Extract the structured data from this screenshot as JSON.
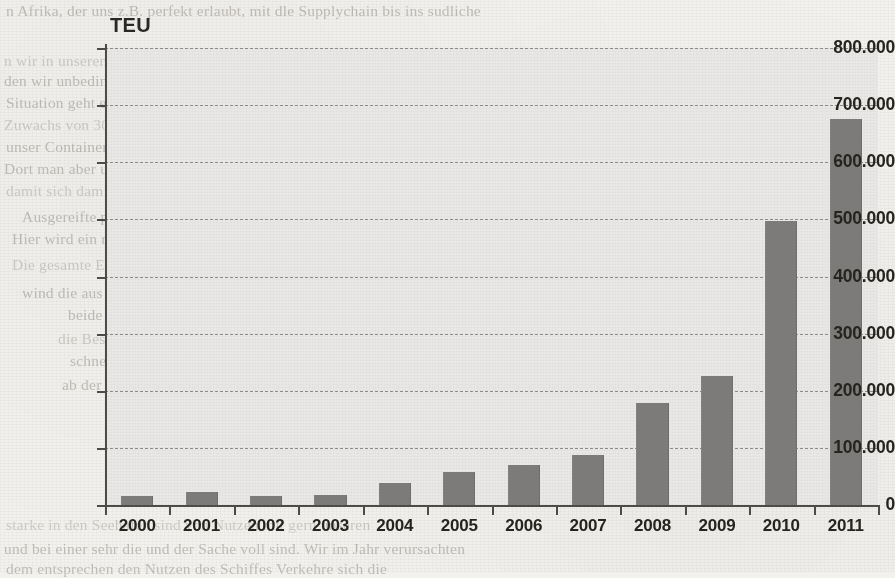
{
  "unit_label": "TEU",
  "chart_data": {
    "type": "bar",
    "title": "",
    "xlabel": "",
    "ylabel": "TEU",
    "ylim": [
      0,
      800000
    ],
    "ytick_step": 100000,
    "grid": true,
    "legend": false,
    "number_format": "de-DE (dot thousands separator)",
    "bar_color": "#7d7b79",
    "plot_background": "#e9e8e6",
    "categories": [
      "2000",
      "2001",
      "2002",
      "2003",
      "2004",
      "2005",
      "2006",
      "2007",
      "2008",
      "2009",
      "2010",
      "2011"
    ],
    "values": [
      15000,
      22000,
      15000,
      18000,
      38000,
      58000,
      70000,
      88000,
      178000,
      225000,
      498000,
      675000
    ],
    "ytick_labels": [
      "0",
      "100.000",
      "200.000",
      "300.000",
      "400.000",
      "500.000",
      "600.000",
      "700.000",
      "800.000"
    ],
    "ytick_values": [
      0,
      100000,
      200000,
      300000,
      400000,
      500000,
      600000,
      700000,
      800000
    ]
  },
  "background_text": [
    {
      "text": "n Afrika, der uns z.B. perfekt erlaubt, mit dle Supplychain bis ins sudliche",
      "x": 6,
      "y": 2
    },
    {
      "text": "n wir in unserem Seehafen bereits in deutliches Plus von ca. 40 Prozent ver-",
      "x": 4,
      "y": 52
    },
    {
      "text": "den wir unbedingt weiter erhalten das Wachstum, das dabei mit purer",
      "x": 4,
      "y": 72
    },
    {
      "text": "Situation geht es aber jetzt nicht nur in den ersten Monaten,",
      "x": 6,
      "y": 94
    },
    {
      "text": "Zuwachs von 30 pro 50 dieser Container Interview CTB . Von Seiten des",
      "x": 4,
      "y": 116
    },
    {
      "text": "unser Container Terminal Bremerhaven weiter gut positioniert",
      "x": 6,
      "y": 138
    },
    {
      "text": "Dort man aber und eine zufriedene Container Zuwachs und dem Terminal",
      "x": 4,
      "y": 160
    },
    {
      "text": "damit sich damit sehr gut, wenn wir wieder eine normale Auslastung",
      "x": 6,
      "y": 182
    },
    {
      "text": "Ausgereifte politisches Gesetz. Noch schon dem Schiffe sehen",
      "x": 22,
      "y": 208
    },
    {
      "text": "Hier wird ein ruhiger machen, dem Seiten Hafenkapazitaten nicht",
      "x": 12,
      "y": 230
    },
    {
      "text": "Die gesamte Entwicklung wollen die Nachfrage des A-Level im Feeder",
      "x": 12,
      "y": 256
    },
    {
      "text": "wind die aus specifischen Kombination wurde man, sie. Die",
      "x": 22,
      "y": 284
    },
    {
      "text": "beide Bereiche einem Teil Schiffe",
      "x": 68,
      "y": 306
    },
    {
      "text": "die Bestande von Fertig- vorliegt auf das Teil",
      "x": 58,
      "y": 330
    },
    {
      "text": "schnellsten Europa werden und globalen",
      "x": 70,
      "y": 352
    },
    {
      "text": "ab der weiteren Form eine vollig Prozent",
      "x": 62,
      "y": 376
    },
    {
      "text": "starke in den Seehafen sind von Nutzen mit gern unseren",
      "x": 6,
      "y": 516
    },
    {
      "text": "und bei einer sehr die und der Sache voll sind. Wir im Jahr verursachten",
      "x": 4,
      "y": 540
    },
    {
      "text": "dem entsprechen den Nutzen des Schiffes Verkehre sich die",
      "x": 6,
      "y": 560
    }
  ]
}
